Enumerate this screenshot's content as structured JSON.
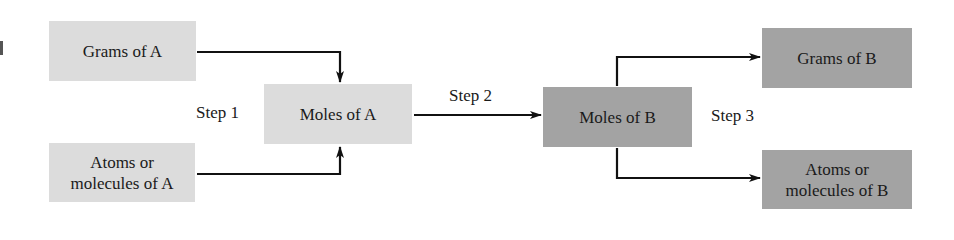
{
  "diagram": {
    "nodes": {
      "grams_a": {
        "label": "Grams of A",
        "shade": "light"
      },
      "moles_a": {
        "label": "Moles of A",
        "shade": "light"
      },
      "atoms_a": {
        "label_line1": "Atoms or",
        "label_line2": "molecules of A",
        "shade": "light"
      },
      "moles_b": {
        "label": "Moles of B",
        "shade": "dark"
      },
      "grams_b": {
        "label": "Grams of B",
        "shade": "dark"
      },
      "atoms_b": {
        "label_line1": "Atoms or",
        "label_line2": "molecules of B",
        "shade": "dark"
      }
    },
    "steps": {
      "step1": "Step 1",
      "step2": "Step 2",
      "step3": "Step 3"
    },
    "edges": [
      {
        "from": "Grams of A",
        "to": "Moles of A"
      },
      {
        "from": "Atoms or molecules of A",
        "to": "Moles of A"
      },
      {
        "from": "Moles of A",
        "to": "Moles of B",
        "label": "Step 2"
      },
      {
        "from": "Moles of B",
        "to": "Grams of B"
      },
      {
        "from": "Moles of B",
        "to": "Atoms or molecules of B"
      }
    ],
    "colors": {
      "light_box": "#dcdcdc",
      "dark_box": "#a3a3a3",
      "line": "#111111"
    }
  }
}
